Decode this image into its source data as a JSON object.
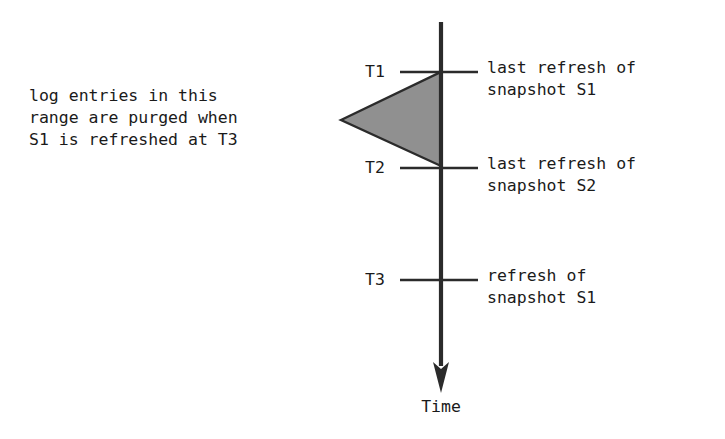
{
  "diagram": {
    "axis": {
      "name": "time-axis",
      "label": "Time",
      "direction": "downward",
      "color": "#2b2b2b"
    },
    "annotation": {
      "line1": "log entries in this",
      "line2": "range are purged when",
      "line3": "S1 is refreshed at T3",
      "pointer": "left-pointing-triangle",
      "fill_color": "#909090",
      "stroke_color": "#2b2b2b"
    },
    "ticks": [
      {
        "id": "T1",
        "time_label": "T1",
        "event_line1": "last refresh of",
        "event_line2": "snapshot S1"
      },
      {
        "id": "T2",
        "time_label": "T2",
        "event_line1": "last refresh of",
        "event_line2": "snapshot S2"
      },
      {
        "id": "T3",
        "time_label": "T3",
        "event_line1": "refresh of",
        "event_line2": "snapshot S1"
      }
    ]
  }
}
